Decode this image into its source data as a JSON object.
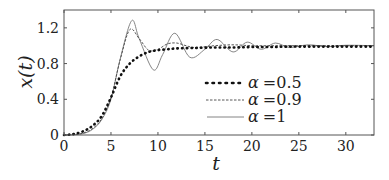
{
  "chart_data": {
    "type": "line",
    "title": "",
    "xlabel": "t",
    "ylabel": "x(t)",
    "xlim": [
      0,
      33
    ],
    "ylim": [
      0,
      1.4
    ],
    "xticks": [
      0,
      5,
      10,
      15,
      20,
      25,
      30
    ],
    "yticks": [
      0,
      0.4,
      0.8,
      1.2
    ],
    "xtick_labels": [
      "0",
      "5",
      "10",
      "15",
      "20",
      "25",
      "30"
    ],
    "ytick_labels": [
      "0",
      "0.4",
      "0.8",
      "1.2"
    ],
    "grid": false,
    "legend_position": "center-right",
    "series": [
      {
        "name": "α = 0.5",
        "style": "dotted-thick",
        "x": [
          0,
          1,
          2,
          3,
          4,
          5,
          6,
          7,
          8,
          9,
          10,
          11,
          12,
          14,
          16,
          18,
          20,
          22,
          24,
          26,
          28,
          30,
          33
        ],
        "y": [
          0,
          0.01,
          0.04,
          0.1,
          0.21,
          0.42,
          0.66,
          0.8,
          0.88,
          0.93,
          0.95,
          0.96,
          0.97,
          0.975,
          0.98,
          0.98,
          0.985,
          0.985,
          0.99,
          0.99,
          0.99,
          0.99,
          0.99
        ]
      },
      {
        "name": "α = 0.9",
        "style": "dashed",
        "x": [
          0,
          1,
          2,
          3,
          4,
          5,
          6,
          7,
          8,
          9,
          10,
          11,
          12,
          13,
          14,
          16,
          18,
          20,
          22,
          24,
          26,
          28,
          30,
          33
        ],
        "y": [
          0,
          0.005,
          0.02,
          0.07,
          0.18,
          0.42,
          0.85,
          1.18,
          1.08,
          0.95,
          0.96,
          1.02,
          1.03,
          1.0,
          0.98,
          1.0,
          1.01,
          1.0,
          1.0,
          1.0,
          1.0,
          1.0,
          1.0,
          1.0
        ]
      },
      {
        "name": "α = 1",
        "style": "solid-thin",
        "x": [
          0,
          1,
          2,
          3,
          4,
          5,
          6,
          7.2,
          8,
          9.5,
          10.5,
          11.8,
          13.4,
          15,
          16.3,
          18,
          19.5,
          21,
          22.5,
          24,
          26,
          28,
          30,
          33
        ],
        "y": [
          0,
          0.002,
          0.015,
          0.06,
          0.17,
          0.4,
          0.86,
          1.28,
          1.08,
          0.73,
          0.9,
          1.14,
          0.87,
          0.96,
          1.07,
          0.93,
          1.04,
          0.96,
          1.03,
          0.98,
          1.01,
          0.99,
          1.005,
          1.0
        ]
      }
    ]
  },
  "legend": {
    "items": [
      {
        "symbol": "α",
        "eq": "=",
        "value": "0.5"
      },
      {
        "symbol": "α",
        "eq": "=",
        "value": "0.9"
      },
      {
        "symbol": "α",
        "eq": "=",
        "value": "1"
      }
    ]
  },
  "axes": {
    "xlabel": "t",
    "ylabel": "x(t)"
  }
}
